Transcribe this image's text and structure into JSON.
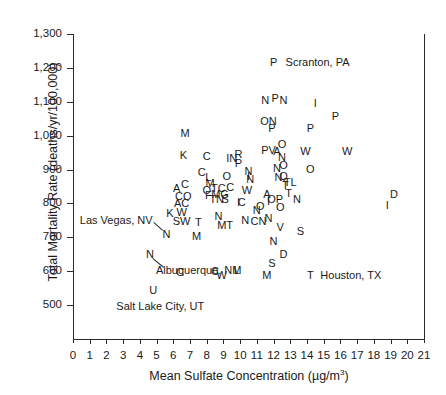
{
  "chart_data": {
    "type": "scatter",
    "title": "",
    "xlabel": "Mean Sulfate Concentration (µg/m³)",
    "ylabel": "Total Mortality Rate (deaths/yr/100,000)",
    "xlim": [
      0,
      21
    ],
    "ylim": [
      400,
      1300
    ],
    "xticks": [
      0,
      1,
      2,
      3,
      4,
      5,
      6,
      7,
      8,
      9,
      10,
      11,
      12,
      13,
      14,
      15,
      16,
      17,
      18,
      19,
      20,
      21
    ],
    "xtick_labels": [
      "0",
      "1",
      "2",
      "3",
      "4",
      "5",
      "6",
      "7",
      "8",
      "9",
      "10",
      "11",
      "12",
      "13",
      "14",
      "15",
      "16",
      "17",
      "18",
      "19",
      "20",
      "21"
    ],
    "yticks": [
      500,
      600,
      700,
      800,
      900,
      1000,
      1100,
      1200,
      1300
    ],
    "ytick_labels": [
      "500",
      "600",
      "700",
      "800",
      "900",
      "1,000",
      "1,100",
      "1,200",
      "1,300"
    ],
    "grid": false,
    "legend": "none",
    "marker_style": "city-initial-letter",
    "points": [
      {
        "label": "M",
        "x": 6.7,
        "y": 1008
      },
      {
        "label": "K",
        "x": 6.6,
        "y": 943
      },
      {
        "label": "C",
        "x": 8.0,
        "y": 940
      },
      {
        "label": "A",
        "x": 6.2,
        "y": 845
      },
      {
        "label": "C",
        "x": 6.7,
        "y": 858
      },
      {
        "label": "CO",
        "x": 6.6,
        "y": 822
      },
      {
        "label": "AC",
        "x": 6.5,
        "y": 800
      },
      {
        "label": "K",
        "x": 5.8,
        "y": 772
      },
      {
        "label": "W",
        "x": 6.5,
        "y": 775
      },
      {
        "label": "SW",
        "x": 6.5,
        "y": 748
      },
      {
        "label": "T",
        "x": 7.5,
        "y": 745
      },
      {
        "label": "N",
        "x": 5.6,
        "y": 710
      },
      {
        "label": "N",
        "x": 4.6,
        "y": 650
      },
      {
        "label": "C",
        "x": 6.4,
        "y": 598
      },
      {
        "label": "U",
        "x": 4.8,
        "y": 545
      },
      {
        "label": "M",
        "x": 8.2,
        "y": 860
      },
      {
        "label": "F",
        "x": 8.1,
        "y": 826
      },
      {
        "label": "O",
        "x": 8.0,
        "y": 840
      },
      {
        "label": "TC",
        "x": 8.7,
        "y": 845
      },
      {
        "label": "MG",
        "x": 8.8,
        "y": 828
      },
      {
        "label": "TN",
        "x": 8.6,
        "y": 812
      },
      {
        "label": "S",
        "x": 9.1,
        "y": 812
      },
      {
        "label": "C",
        "x": 9.4,
        "y": 848
      },
      {
        "label": "C",
        "x": 7.7,
        "y": 892
      },
      {
        "label": "L",
        "x": 8.1,
        "y": 878
      },
      {
        "label": "N",
        "x": 8.7,
        "y": 762
      },
      {
        "label": "MT",
        "x": 9.1,
        "y": 735
      },
      {
        "label": "M",
        "x": 7.4,
        "y": 703
      },
      {
        "label": "C",
        "x": 8.5,
        "y": 600
      },
      {
        "label": "W",
        "x": 8.9,
        "y": 588
      },
      {
        "label": "L",
        "x": 9.8,
        "y": 605
      },
      {
        "label": "O",
        "x": 9.2,
        "y": 880
      },
      {
        "label": "IN",
        "x": 9.5,
        "y": 935
      },
      {
        "label": "R",
        "x": 9.9,
        "y": 945
      },
      {
        "label": "P",
        "x": 9.9,
        "y": 918
      },
      {
        "label": "N",
        "x": 10.5,
        "y": 895
      },
      {
        "label": "N",
        "x": 10.6,
        "y": 872
      },
      {
        "label": "I",
        "x": 10.5,
        "y": 880
      },
      {
        "label": "C",
        "x": 10.1,
        "y": 803
      },
      {
        "label": "W",
        "x": 10.4,
        "y": 840
      },
      {
        "label": "I",
        "x": 9.9,
        "y": 805
      },
      {
        "label": "N",
        "x": 10.3,
        "y": 750
      },
      {
        "label": "N",
        "x": 11.5,
        "y": 1105
      },
      {
        "label": "P",
        "x": 12.1,
        "y": 1110
      },
      {
        "label": "N",
        "x": 12.6,
        "y": 1105
      },
      {
        "label": "P",
        "x": 12.0,
        "y": 1218
      },
      {
        "label": "ON",
        "x": 11.7,
        "y": 1042
      },
      {
        "label": "P",
        "x": 11.9,
        "y": 1022
      },
      {
        "label": "PV",
        "x": 11.7,
        "y": 958
      },
      {
        "label": "A",
        "x": 12.2,
        "y": 955
      },
      {
        "label": "N",
        "x": 12.5,
        "y": 938
      },
      {
        "label": "O",
        "x": 12.5,
        "y": 975
      },
      {
        "label": "N",
        "x": 12.2,
        "y": 905
      },
      {
        "label": "O",
        "x": 12.6,
        "y": 912
      },
      {
        "label": "N",
        "x": 12.3,
        "y": 878
      },
      {
        "label": "Q",
        "x": 12.6,
        "y": 880
      },
      {
        "label": "T",
        "x": 12.7,
        "y": 855
      },
      {
        "label": "TL",
        "x": 13.0,
        "y": 862
      },
      {
        "label": "A",
        "x": 11.6,
        "y": 828
      },
      {
        "label": "I",
        "x": 11.7,
        "y": 808
      },
      {
        "label": "OP",
        "x": 12.1,
        "y": 812
      },
      {
        "label": "T",
        "x": 12.9,
        "y": 830
      },
      {
        "label": "N",
        "x": 13.4,
        "y": 812
      },
      {
        "label": "O",
        "x": 12.4,
        "y": 790
      },
      {
        "label": "N",
        "x": 11.7,
        "y": 758
      },
      {
        "label": "V",
        "x": 12.4,
        "y": 730
      },
      {
        "label": "N",
        "x": 12.0,
        "y": 690
      },
      {
        "label": "D",
        "x": 12.6,
        "y": 650
      },
      {
        "label": "S",
        "x": 11.9,
        "y": 625
      },
      {
        "label": "M",
        "x": 11.6,
        "y": 588
      },
      {
        "label": "N",
        "x": 11.0,
        "y": 782
      },
      {
        "label": "O",
        "x": 11.2,
        "y": 792
      },
      {
        "label": "CN",
        "x": 11.1,
        "y": 748
      },
      {
        "label": "I",
        "x": 14.5,
        "y": 1095
      },
      {
        "label": "P",
        "x": 14.2,
        "y": 1022
      },
      {
        "label": "W",
        "x": 13.9,
        "y": 955
      },
      {
        "label": "O",
        "x": 14.2,
        "y": 902
      },
      {
        "label": "S",
        "x": 13.6,
        "y": 718
      },
      {
        "label": "T",
        "x": 14.2,
        "y": 590
      },
      {
        "label": "P",
        "x": 15.7,
        "y": 1058
      },
      {
        "label": "W",
        "x": 16.4,
        "y": 955
      },
      {
        "label": "D",
        "x": 19.2,
        "y": 828
      },
      {
        "label": "I",
        "x": 18.8,
        "y": 795
      }
    ],
    "annotations": [
      {
        "text": "Scranton, PA",
        "marker": "P",
        "marker_x": 12.0,
        "marker_y": 1218
      },
      {
        "text": "Houston, TX",
        "marker": "T",
        "marker_x": 14.2,
        "marker_y": 590
      },
      {
        "text": "Las Vegas, NV",
        "marker": "N",
        "marker_x": 5.6,
        "marker_y": 710
      },
      {
        "text": "Albuquerque, NM",
        "marker": "N",
        "marker_x": 4.6,
        "marker_y": 650
      },
      {
        "text": "Salt Lake City, UT",
        "marker": "U",
        "marker_x": 4.8,
        "marker_y": 545
      }
    ]
  },
  "axis": {
    "x_title": "Mean Sulfate Concentration (µg/m³)",
    "x_unit_base": "Mean Sulfate Concentration (µg/m",
    "x_unit_sup": "3",
    "x_unit_close": ")",
    "y_title": "Total Mortality Rate (deaths/yr/100,000)"
  },
  "callouts": {
    "scranton": "Scranton, PA",
    "houston": "Houston, TX",
    "las_vegas": "Las Vegas, NV",
    "albuquerque": "Albuquerque, NM",
    "salt_lake": "Salt Lake City, UT"
  },
  "colors": {
    "axis": "#2b2b2b",
    "text": "#1a1a1a",
    "background": "#ffffff"
  }
}
